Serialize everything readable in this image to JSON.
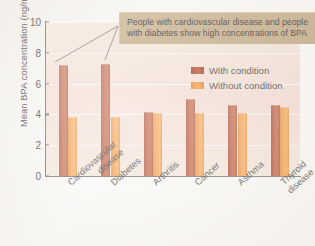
{
  "chart_data": {
    "type": "bar",
    "title": "",
    "xlabel": "",
    "ylabel": "Mean BPA concentration (ng/ml)",
    "ylim": [
      0,
      10
    ],
    "yticks": [
      0,
      2,
      4,
      6,
      8,
      10
    ],
    "grid": true,
    "legend_position": "upper right",
    "categories": [
      "Cardiovascular\ndisease",
      "Diabetes",
      "Arthritis",
      "Cancer",
      "Asthma",
      "Thyroid\ndisease"
    ],
    "series": [
      {
        "name": "With condition",
        "color": "#b5391a",
        "values": [
          7.2,
          7.3,
          4.15,
          5.0,
          4.6,
          4.6
        ]
      },
      {
        "name": "Without condition",
        "color": "#f28a28",
        "values": [
          3.8,
          3.85,
          4.1,
          4.1,
          4.1,
          4.45
        ]
      }
    ],
    "annotations": [
      {
        "text": "People with cardiovascular disease and people with diabetes show high concentrations of BPA",
        "points_to": [
          "Cardiovascular disease",
          "Diabetes"
        ]
      }
    ]
  },
  "legend": {
    "items": [
      {
        "label": "With condition"
      },
      {
        "label": "Without condition"
      }
    ]
  },
  "annotation": {
    "text": "People with cardiovascular disease and people with diabetes show high concentrations of BPA"
  },
  "colors": {
    "with_condition": "#b5391a",
    "without_condition": "#f28a28",
    "plot_background": "#f0d6cd",
    "annotation_box": "#c0a57e",
    "axis": "#6e6a66"
  }
}
